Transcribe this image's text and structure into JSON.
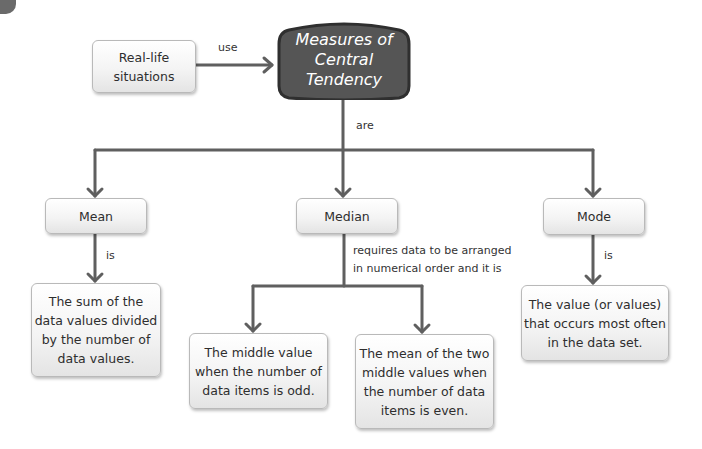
{
  "diagram": {
    "title_node": {
      "label": "Measures of\nCentral\nTendency",
      "fill": "#555555",
      "border": "#333333"
    },
    "source_node": {
      "label": "Real-life\nsituations"
    },
    "edges": {
      "use": "use",
      "are": "are",
      "mean_is": "is",
      "median_requires": "requires data to be arranged\nin numerical order and it is",
      "mode_is": "is"
    },
    "measures": [
      {
        "label": "Mean",
        "description": "The sum of the\ndata values divided\nby the number of\ndata values."
      },
      {
        "label": "Median"
      },
      {
        "label": "Mode",
        "description": "The value (or values)\nthat occurs most often\nin the data set."
      }
    ],
    "median_cases": [
      {
        "description": "The middle value\nwhen the number of\ndata items is odd."
      },
      {
        "description": "The mean of the two\nmiddle values when\nthe number of data\nitems is even."
      }
    ],
    "colors": {
      "connector": "#5f5f5f",
      "box_border": "#b9b9b9",
      "text": "#2e2e2e"
    }
  }
}
